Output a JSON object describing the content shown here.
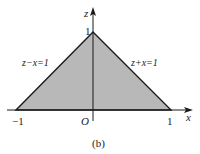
{
  "figure": {
    "caption": "(b)",
    "region_fill": "#b8b8b8",
    "line_color": "#1a1a1a",
    "axes": {
      "x_label": "x",
      "z_label": "z",
      "origin_label": "O"
    },
    "ticks": {
      "x_neg": "−1",
      "x_pos": "1",
      "z_pos": "1"
    },
    "lines": {
      "left": "z−x=1",
      "right": "z+x=1"
    },
    "vertices": [
      {
        "x": -1,
        "z": 0
      },
      {
        "x": 0,
        "z": 1
      },
      {
        "x": 1,
        "z": 0
      }
    ]
  }
}
